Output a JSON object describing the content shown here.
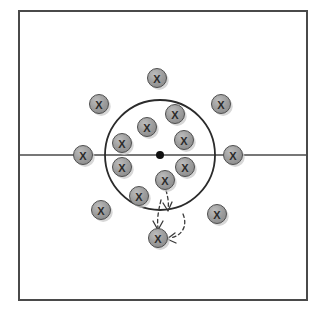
{
  "diagram": {
    "type": "sports-play-diagram",
    "colors": {
      "field_background": "#ffffff",
      "boundary_line": "#4a4a4a",
      "center_line": "#4a4a4a",
      "circle_line": "#2b2b2b",
      "center_dot": "#111111",
      "marker_fill": "#9a9a9a",
      "marker_stroke": "#4f4f4f",
      "marker_text": "#2b2b2b",
      "marker_shadow": "#c9c9c9",
      "arrow_line": "#3a3a3a"
    },
    "field": {
      "name": "playing-area",
      "x": 19,
      "y": 11,
      "width": 288,
      "height": 289,
      "stroke_width": 2
    },
    "center_line": {
      "name": "halfway-line",
      "x1": 19,
      "y1": 155,
      "x2": 307,
      "y2": 155,
      "stroke_width": 1.6
    },
    "center_circle": {
      "name": "center-circle",
      "cx": 160,
      "cy": 155,
      "r": 55,
      "stroke_width": 1.8
    },
    "center_dot": {
      "name": "center-spot",
      "cx": 160,
      "cy": 155,
      "r": 4
    },
    "marker_label": "X",
    "marker_radius": 9.5,
    "markers": [
      {
        "id": "player-1",
        "label": "X",
        "cx": 157,
        "cy": 78,
        "zone": "outside-top"
      },
      {
        "id": "player-2",
        "label": "X",
        "cx": 99,
        "cy": 104,
        "zone": "outside-upper-left"
      },
      {
        "id": "player-3",
        "label": "X",
        "cx": 221,
        "cy": 104,
        "zone": "outside-upper-right"
      },
      {
        "id": "player-4",
        "label": "X",
        "cx": 175,
        "cy": 114,
        "zone": "inside-upper-right"
      },
      {
        "id": "player-5",
        "label": "X",
        "cx": 147,
        "cy": 127,
        "zone": "inside-upper-left"
      },
      {
        "id": "player-6",
        "label": "X",
        "cx": 122,
        "cy": 143,
        "zone": "inside-left"
      },
      {
        "id": "player-7",
        "label": "X",
        "cx": 184,
        "cy": 140,
        "zone": "inside-right"
      },
      {
        "id": "player-8",
        "label": "X",
        "cx": 83,
        "cy": 155,
        "zone": "outside-left-line"
      },
      {
        "id": "player-9",
        "label": "X",
        "cx": 233,
        "cy": 155,
        "zone": "outside-right-line"
      },
      {
        "id": "player-10",
        "label": "X",
        "cx": 122,
        "cy": 167,
        "zone": "inside-lower-left"
      },
      {
        "id": "player-11",
        "label": "X",
        "cx": 185,
        "cy": 167,
        "zone": "inside-lower-right"
      },
      {
        "id": "player-12",
        "label": "X",
        "cx": 165,
        "cy": 180,
        "zone": "inside-bottom-center"
      },
      {
        "id": "player-13",
        "label": "X",
        "cx": 139,
        "cy": 196,
        "zone": "inside-bottom-left"
      },
      {
        "id": "player-14",
        "label": "X",
        "cx": 101,
        "cy": 210,
        "zone": "outside-lower-left"
      },
      {
        "id": "player-15",
        "label": "X",
        "cx": 217,
        "cy": 214,
        "zone": "outside-lower-right"
      },
      {
        "id": "player-16",
        "label": "X",
        "cx": 158,
        "cy": 238,
        "zone": "outside-bottom"
      }
    ],
    "arrows": [
      {
        "id": "movement-arrow-1",
        "name": "dashed-arrow-down",
        "path": "M 166 190 C 168 198 169 203 168 209",
        "head": "M 163 203 L 168 211 L 172 202",
        "style": "dashed"
      },
      {
        "id": "movement-arrow-2",
        "name": "dashed-arrow-curve-left",
        "path": "M 183 214 C 188 226 182 236 170 238",
        "head": "M 175 233 L 167 239 L 176 243",
        "style": "dashed"
      },
      {
        "id": "movement-arrow-3",
        "name": "dashed-arrow-down-left",
        "path": "M 161 200 C 158 212 157 220 158 228",
        "head": "M 153 221 L 158 230 L 163 221",
        "style": "dashed"
      }
    ]
  }
}
